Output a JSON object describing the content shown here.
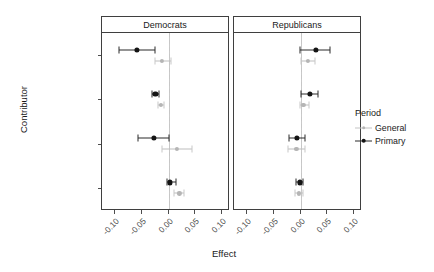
{
  "chart_data": {
    "type": "scatter",
    "title": "",
    "xlabel": "Effect",
    "ylabel": "Contributor",
    "legend_title": "Period",
    "legend_position": "right",
    "grid": false,
    "zero_reference_line": 0.0,
    "xlim": [
      -0.125,
      0.115
    ],
    "xticks": [
      -0.1,
      -0.05,
      0.0,
      0.05,
      0.1
    ],
    "xticklabels": [
      "-0.10",
      "-0.05",
      "0.00",
      "0.05",
      "0.10"
    ],
    "categories": [
      "IGAs",
      "Ideo/issue PACs",
      "Party insiders",
      "Party Cmtes"
    ],
    "panels": [
      {
        "label": "Democrats",
        "series": [
          {
            "name": "Primary",
            "color": "#141414",
            "points": [
              {
                "category": "IGAs",
                "estimate": -0.06,
                "ci_low": -0.093,
                "ci_high": -0.026
              },
              {
                "category": "Ideo/issue PACs",
                "estimate": -0.025,
                "ci_low": -0.031,
                "ci_high": -0.018
              },
              {
                "category": "Party insiders",
                "estimate": -0.028,
                "ci_low": -0.058,
                "ci_high": 0.0
              },
              {
                "category": "Party Cmtes",
                "estimate": 0.002,
                "ci_low": -0.004,
                "ci_high": 0.013
              }
            ]
          },
          {
            "name": "General",
            "color": "#b5b5b5",
            "points": [
              {
                "category": "IGAs",
                "estimate": -0.013,
                "ci_low": -0.026,
                "ci_high": 0.005
              },
              {
                "category": "Ideo/issue PACs",
                "estimate": -0.014,
                "ci_low": -0.02,
                "ci_high": -0.008
              },
              {
                "category": "Party insiders",
                "estimate": 0.015,
                "ci_low": -0.012,
                "ci_high": 0.043
              },
              {
                "category": "Party Cmtes",
                "estimate": 0.02,
                "ci_low": 0.01,
                "ci_high": 0.029
              }
            ]
          }
        ]
      },
      {
        "label": "Republicans",
        "series": [
          {
            "name": "Primary",
            "color": "#141414",
            "points": [
              {
                "category": "IGAs",
                "estimate": 0.028,
                "ci_low": -0.001,
                "ci_high": 0.055
              },
              {
                "category": "Ideo/issue PACs",
                "estimate": 0.017,
                "ci_low": 0.0,
                "ci_high": 0.033
              },
              {
                "category": "Party insiders",
                "estimate": -0.007,
                "ci_low": -0.022,
                "ci_high": 0.008
              },
              {
                "category": "Party Cmtes",
                "estimate": -0.002,
                "ci_low": -0.008,
                "ci_high": 0.004
              }
            ]
          },
          {
            "name": "General",
            "color": "#b5b5b5",
            "points": [
              {
                "category": "IGAs",
                "estimate": 0.013,
                "ci_low": 0.0,
                "ci_high": 0.026
              },
              {
                "category": "Ideo/issue PACs",
                "estimate": 0.005,
                "ci_low": -0.001,
                "ci_high": 0.015
              },
              {
                "category": "Party insiders",
                "estimate": -0.008,
                "ci_low": -0.024,
                "ci_high": 0.008
              },
              {
                "category": "Party Cmtes",
                "estimate": -0.003,
                "ci_low": -0.01,
                "ci_high": 0.004
              }
            ]
          }
        ]
      }
    ],
    "legend_entries": [
      {
        "label": "General",
        "color": "#b5b5b5"
      },
      {
        "label": "Primary",
        "color": "#141414"
      }
    ]
  }
}
